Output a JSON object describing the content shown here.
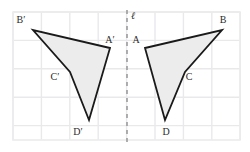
{
  "figure": {
    "width": 250,
    "height": 152,
    "background_color": "#ffffff"
  },
  "grid": {
    "line_color": "#e9e9ec",
    "border_color": "#ececed",
    "cell_size": 28.4,
    "x_start": 13,
    "y_start": 12,
    "x_end": 240,
    "y_end": 140,
    "columns": 8,
    "rows": 4.5
  },
  "mirror_line": {
    "label": "ℓ",
    "label_x": 133,
    "label_y": 19,
    "x": 127,
    "y_top": 10,
    "y_bottom": 145,
    "color": "#9b9b9b",
    "dash": "4 4",
    "stroke_width": 1.6
  },
  "shapes": {
    "stroke_color": "#1a1a1a",
    "stroke_width": 1.8,
    "fill_color": "#ececec",
    "preimage": {
      "name": "ABCD",
      "points": "145,48 222,30 185,72 165,120",
      "vertices": [
        {
          "label": "A",
          "x": 145,
          "y": 48,
          "label_x": 136,
          "label_y": 43
        },
        {
          "label": "B",
          "x": 222,
          "y": 30,
          "label_x": 223,
          "label_y": 23
        },
        {
          "label": "C",
          "x": 185,
          "y": 72,
          "label_x": 189,
          "label_y": 80
        },
        {
          "label": "D",
          "x": 165,
          "y": 120,
          "label_x": 166,
          "label_y": 135
        }
      ]
    },
    "image": {
      "name": "A'B'C'D'",
      "points": "110,48 33,30 70,72 89,120",
      "vertices": [
        {
          "label": "A′",
          "x": 110,
          "y": 48,
          "label_x": 110,
          "label_y": 43
        },
        {
          "label": "B′",
          "x": 33,
          "y": 30,
          "label_x": 21,
          "label_y": 23
        },
        {
          "label": "C′",
          "x": 70,
          "y": 72,
          "label_x": 55,
          "label_y": 80
        },
        {
          "label": "D′",
          "x": 89,
          "y": 120,
          "label_x": 78,
          "label_y": 135
        }
      ]
    }
  }
}
